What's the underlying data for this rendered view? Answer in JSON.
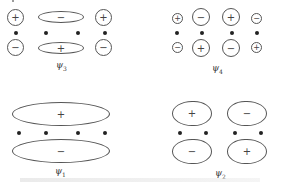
{
  "diagrams": {
    "psi3": {
      "label": "ψ",
      "subscript": "3",
      "top": [
        "+",
        "−",
        "+"
      ],
      "bottom": [
        "−",
        "+",
        "−"
      ]
    },
    "psi4": {
      "label": "ψ",
      "subscript": "4",
      "top": [
        "+",
        "−",
        "+",
        "−"
      ],
      "bottom": [
        "−",
        "+",
        "−",
        "+"
      ]
    },
    "psi1": {
      "label": "ψ",
      "subscript": "1",
      "top": "+",
      "bottom": "−"
    },
    "psi2": {
      "label": "ψ",
      "subscript": "2",
      "top": [
        "+",
        "−"
      ],
      "bottom": [
        "−",
        "+"
      ]
    }
  },
  "colors": {
    "stroke": "#555555",
    "dot": "#222222",
    "background": "#ffffff"
  }
}
